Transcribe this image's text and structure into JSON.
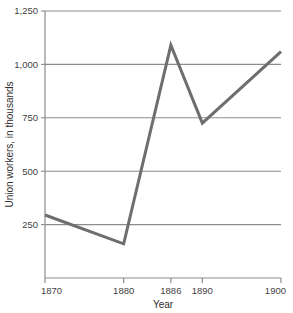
{
  "chart_data": {
    "type": "line",
    "title": "",
    "xlabel": "Year",
    "ylabel": "Union workers, in thousands",
    "x": [
      1870,
      1880,
      1886,
      1890,
      1900
    ],
    "values": [
      295,
      160,
      1090,
      725,
      1060
    ],
    "series": [
      {
        "name": "Union workers",
        "values": [
          295,
          160,
          1090,
          725,
          1060
        ]
      }
    ],
    "xlim": [
      1870,
      1900
    ],
    "ylim": [
      0,
      1250
    ],
    "x_tick_labels": [
      "1870",
      "1880",
      "1886",
      "1890",
      "1900"
    ],
    "y_tick_labels": [
      "250",
      "500",
      "750",
      "1,000",
      "1,250"
    ],
    "y_ticks": [
      250,
      500,
      750,
      1000,
      1250
    ],
    "grid": true,
    "grid_axis": "y",
    "legend": "none",
    "line_color": "#6e6e6e",
    "grid_color": "#8c8c8c",
    "axis_color": "#8c8c8c",
    "background": "#ffffff"
  }
}
